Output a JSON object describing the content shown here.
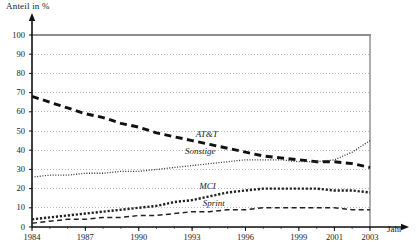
{
  "chart_data": {
    "type": "line",
    "title": "",
    "ylabel": "Anteil in %",
    "xlabel": "Jahr",
    "grid": true,
    "legend_position": "inline-labels",
    "ylim": [
      0,
      100
    ],
    "ytick_labels": [
      "0",
      "10",
      "20",
      "30",
      "40",
      "50",
      "60",
      "70",
      "80",
      "90",
      "100"
    ],
    "ytick_values": [
      0,
      10,
      20,
      30,
      40,
      50,
      60,
      70,
      80,
      90,
      100
    ],
    "xtick_labels": [
      "1984",
      "1987",
      "1990",
      "1993",
      "1996",
      "1999",
      "2001",
      "2003"
    ],
    "xtick_values": [
      1984,
      1987,
      1990,
      1993,
      1996,
      1999,
      2001,
      2003
    ],
    "xlim": [
      1984,
      2003
    ],
    "x": [
      1984,
      1985,
      1986,
      1987,
      1988,
      1989,
      1990,
      1991,
      1992,
      1993,
      1994,
      1995,
      1996,
      1997,
      1998,
      1999,
      2000,
      2001,
      2002,
      2003
    ],
    "series": [
      {
        "name": "AT&T",
        "label": "AT&T",
        "style": "thick-dashed",
        "color": "#111111",
        "label_x": 1993.2,
        "label_y": 48,
        "values": [
          68,
          65,
          62,
          59,
          57,
          54,
          52,
          49,
          47,
          45,
          43,
          41,
          39,
          37,
          36,
          35,
          34,
          34,
          33,
          31
        ]
      },
      {
        "name": "Sonstige",
        "label": "Sonstige",
        "style": "fine-dotted",
        "color": "#333333",
        "label_x": 1992.6,
        "label_y": 39,
        "values": [
          26,
          27,
          27,
          28,
          28,
          29,
          29,
          30,
          31,
          32,
          33,
          34,
          35,
          35,
          35,
          34,
          34,
          35,
          39,
          45
        ]
      },
      {
        "name": "MCI",
        "label": "MCI",
        "style": "medium-dotted",
        "color": "#222222",
        "label_x": 1993.4,
        "label_y": 21,
        "values": [
          4,
          5,
          6,
          7,
          8,
          9,
          10,
          11,
          13,
          14,
          16,
          18,
          19,
          20,
          20,
          20,
          20,
          19,
          19,
          18
        ]
      },
      {
        "name": "Sprint",
        "label": "Sprint",
        "style": "thin-dashed",
        "color": "#222222",
        "label_x": 1993.6,
        "label_y": 12,
        "values": [
          2,
          3,
          4,
          4,
          5,
          5,
          6,
          6,
          7,
          8,
          8,
          9,
          9,
          10,
          10,
          10,
          10,
          10,
          9,
          9
        ]
      }
    ]
  },
  "axes": {
    "y_axis_title": "Anteil in %",
    "x_axis_title": "Jahr"
  }
}
